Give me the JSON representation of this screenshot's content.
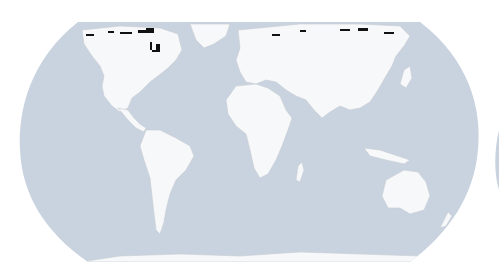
{
  "map": {
    "projection": "Robinson-like world map",
    "ocean_color": "#c9d3e0",
    "land_color": "#f7f8f9",
    "border_color": "#c8ccd2",
    "highlight_color": "#111111",
    "regions_highlighted": [
      "Canadian Arctic Archipelago",
      "Hudson Bay coast",
      "Northern Siberia coast"
    ],
    "next_panel_edge_visible": true
  }
}
